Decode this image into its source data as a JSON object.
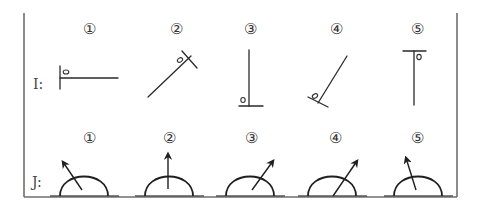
{
  "figure": {
    "rows": [
      {
        "id": "I",
        "label": "I:",
        "items": [
          {
            "number": "①",
            "description": "horizontal stick extending right from short vertical bar; small circle above stick near bar"
          },
          {
            "number": "②",
            "description": "stick rising diagonally up-right to short perpendicular bar; small circle near bar"
          },
          {
            "number": "③",
            "description": "vertical stick standing on short horizontal base; small circle left of stick near base"
          },
          {
            "number": "④",
            "description": "stick leaning up-right from short tilted base at lower left; small circle near base"
          },
          {
            "number": "⑤",
            "description": "vertical stick hanging from short horizontal bar at top; small circle right of stick near bar"
          }
        ]
      },
      {
        "id": "J",
        "label": "J:",
        "items": [
          {
            "number": "①",
            "description": "dome on ground line with arrow pointing up-left"
          },
          {
            "number": "②",
            "description": "dome on ground line with arrow pointing straight up"
          },
          {
            "number": "③",
            "description": "dome on ground line with arrow pointing up-right"
          },
          {
            "number": "④",
            "description": "dome on ground line with arrow pointing up-right, starting from ground"
          },
          {
            "number": "⑤",
            "description": "dome on ground line with arrow pointing slightly up-left"
          }
        ]
      }
    ],
    "colors": {
      "frame": "#6e6e6e",
      "ink": "#2a2a2a",
      "background": "#ffffff"
    }
  }
}
